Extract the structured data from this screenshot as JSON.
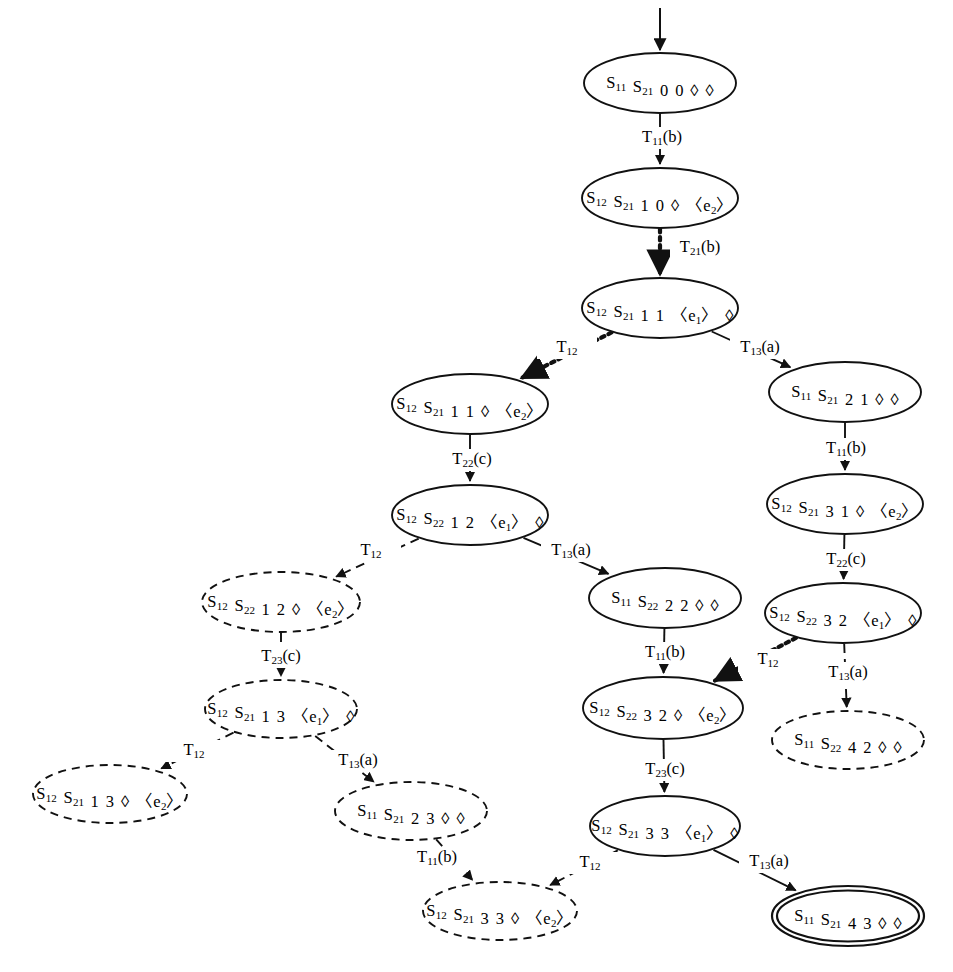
{
  "figure": {
    "kind": "reachability-graph",
    "background_color": "#ffffff",
    "stroke_color": "#111111",
    "text_color": "#000000",
    "diamond_glyph": "◊",
    "node_count": 17,
    "edge_count": 16
  },
  "nodes": [
    {
      "id": "n00",
      "label": "S11 S21 0 0 ◊ ◊",
      "state1": "S11",
      "state2": "S21",
      "counter1": "0",
      "counter2": "0",
      "queue1": "◊",
      "queue2": "◊",
      "style": "solid",
      "cx": 660,
      "cy": 83,
      "rx": 76,
      "ry": 30
    },
    {
      "id": "n10",
      "label": "S12 S21 1 0 ◊ 〈e2〉",
      "state1": "S12",
      "state2": "S21",
      "counter1": "1",
      "counter2": "0",
      "queue1": "◊",
      "queue2": "〈e2〉",
      "style": "solid",
      "cx": 660,
      "cy": 198,
      "rx": 78,
      "ry": 30
    },
    {
      "id": "n11a",
      "label": "S12 S21 1 1 〈e1〉 ◊",
      "state1": "S12",
      "state2": "S21",
      "counter1": "1",
      "counter2": "1",
      "queue1": "〈e1〉",
      "queue2": "◊",
      "style": "solid",
      "cx": 660,
      "cy": 308,
      "rx": 78,
      "ry": 30
    },
    {
      "id": "n11b",
      "label": "S12 S21 1 1 ◊ 〈e2〉",
      "state1": "S12",
      "state2": "S21",
      "counter1": "1",
      "counter2": "1",
      "queue1": "◊",
      "queue2": "〈e2〉",
      "style": "solid",
      "cx": 470,
      "cy": 404,
      "rx": 78,
      "ry": 30
    },
    {
      "id": "n21",
      "label": "S11 S21 2 1 ◊ ◊",
      "state1": "S11",
      "state2": "S21",
      "counter1": "2",
      "counter2": "1",
      "queue1": "◊",
      "queue2": "◊",
      "style": "solid",
      "cx": 845,
      "cy": 392,
      "rx": 76,
      "ry": 30
    },
    {
      "id": "n12",
      "label": "S12 S22 1 2 〈e1〉 ◊",
      "state1": "S12",
      "state2": "S22",
      "counter1": "1",
      "counter2": "2",
      "queue1": "〈e1〉",
      "queue2": "◊",
      "style": "solid",
      "cx": 470,
      "cy": 515,
      "rx": 78,
      "ry": 30
    },
    {
      "id": "n31",
      "label": "S12 S21 3 1 ◊ 〈e2〉",
      "state1": "S12",
      "state2": "S21",
      "counter1": "3",
      "counter2": "1",
      "queue1": "◊",
      "queue2": "〈e2〉",
      "style": "solid",
      "cx": 845,
      "cy": 504,
      "rx": 78,
      "ry": 30
    },
    {
      "id": "n12d",
      "label": "S12 S22 1 2 ◊ 〈e2〉",
      "state1": "S12",
      "state2": "S22",
      "counter1": "1",
      "counter2": "2",
      "queue1": "◊",
      "queue2": "〈e2〉",
      "style": "dashed",
      "cx": 281,
      "cy": 602,
      "rx": 79,
      "ry": 30
    },
    {
      "id": "n22",
      "label": "S11 S22 2 2 ◊ ◊",
      "state1": "S11",
      "state2": "S22",
      "counter1": "2",
      "counter2": "2",
      "queue1": "◊",
      "queue2": "◊",
      "style": "solid",
      "cx": 665,
      "cy": 598,
      "rx": 76,
      "ry": 30
    },
    {
      "id": "n32a",
      "label": "S12 S22 3 2 〈e1〉 ◊",
      "state1": "S12",
      "state2": "S22",
      "counter1": "3",
      "counter2": "2",
      "queue1": "〈e1〉",
      "queue2": "◊",
      "style": "solid",
      "cx": 843,
      "cy": 613,
      "rx": 78,
      "ry": 30
    },
    {
      "id": "n13a",
      "label": "S12 S21 1 3 〈e1〉 ◊",
      "state1": "S12",
      "state2": "S21",
      "counter1": "1",
      "counter2": "3",
      "queue1": "〈e1〉",
      "queue2": "◊",
      "style": "dashed",
      "cx": 281,
      "cy": 709,
      "rx": 76,
      "ry": 29
    },
    {
      "id": "n32b",
      "label": "S12 S22 3 2 ◊ 〈e2〉",
      "state1": "S12",
      "state2": "S22",
      "counter1": "3",
      "counter2": "2",
      "queue1": "◊",
      "queue2": "〈e2〉",
      "style": "solid",
      "cx": 663,
      "cy": 708,
      "rx": 80,
      "ry": 31
    },
    {
      "id": "n42",
      "label": "S11 S22 4 2 ◊ ◊",
      "state1": "S11",
      "state2": "S22",
      "counter1": "4",
      "counter2": "2",
      "queue1": "◊",
      "queue2": "◊",
      "style": "dashed",
      "cx": 848,
      "cy": 740,
      "rx": 76,
      "ry": 29
    },
    {
      "id": "n13b",
      "label": "S12 S21 1 3 ◊ 〈e2〉",
      "state1": "S12",
      "state2": "S21",
      "counter1": "1",
      "counter2": "3",
      "queue1": "◊",
      "queue2": "〈e2〉",
      "style": "dashed",
      "cx": 110,
      "cy": 794,
      "rx": 77,
      "ry": 29
    },
    {
      "id": "n23",
      "label": "S11 S21 2 3 ◊ ◊",
      "state1": "S11",
      "state2": "S21",
      "counter1": "2",
      "counter2": "3",
      "queue1": "◊",
      "queue2": "◊",
      "style": "dashed",
      "cx": 411,
      "cy": 811,
      "rx": 76,
      "ry": 29
    },
    {
      "id": "n33a",
      "label": "S12 S21 3 3 〈e1〉 ◊",
      "state1": "S12",
      "state2": "S21",
      "counter1": "3",
      "counter2": "3",
      "queue1": "〈e1〉",
      "queue2": "◊",
      "style": "solid",
      "cx": 665,
      "cy": 826,
      "rx": 75,
      "ry": 30
    },
    {
      "id": "n33b",
      "label": "S12 S21 3 3 ◊ 〈e2〉",
      "state1": "S12",
      "state2": "S21",
      "counter1": "3",
      "counter2": "3",
      "queue1": "◊",
      "queue2": "〈e2〉",
      "style": "dashed",
      "cx": 500,
      "cy": 911,
      "rx": 77,
      "ry": 29
    },
    {
      "id": "n43",
      "label": "S11 S21 4 3 ◊ ◊",
      "state1": "S11",
      "state2": "S21",
      "counter1": "4",
      "counter2": "3",
      "queue1": "◊",
      "queue2": "◊",
      "style": "double",
      "cx": 848,
      "cy": 916,
      "rx": 76,
      "ry": 30
    }
  ],
  "edges": [
    {
      "id": "e_init",
      "from": "",
      "to": "n00",
      "label": "",
      "style": "solid",
      "label_x": 0,
      "label_y": 0
    },
    {
      "id": "e1",
      "from": "n00",
      "to": "n10",
      "label": "T11(b)",
      "trans": "T11",
      "event": "b",
      "style": "solid",
      "label_x": 662,
      "label_y": 138
    },
    {
      "id": "e2",
      "from": "n10",
      "to": "n11a",
      "label": "T21(b)",
      "trans": "T21",
      "event": "b",
      "style": "dotted",
      "label_x": 700,
      "label_y": 248
    },
    {
      "id": "e3",
      "from": "n11a",
      "to": "n11b",
      "label": "T12",
      "trans": "T12",
      "event": "",
      "style": "dotted",
      "label_x": 567,
      "label_y": 348
    },
    {
      "id": "e4",
      "from": "n11a",
      "to": "n21",
      "label": "T13(a)",
      "trans": "T13",
      "event": "a",
      "style": "solid",
      "label_x": 760,
      "label_y": 348
    },
    {
      "id": "e5",
      "from": "n11b",
      "to": "n12",
      "label": "T22(c)",
      "trans": "T22",
      "event": "c",
      "style": "solid",
      "label_x": 472,
      "label_y": 460
    },
    {
      "id": "e6",
      "from": "n21",
      "to": "n31",
      "label": "T11(b)",
      "trans": "T11",
      "event": "b",
      "style": "solid",
      "label_x": 846,
      "label_y": 449
    },
    {
      "id": "e7",
      "from": "n12",
      "to": "n12d",
      "label": "T12",
      "trans": "T12",
      "event": "",
      "style": "dashed",
      "label_x": 371,
      "label_y": 551
    },
    {
      "id": "e8",
      "from": "n12",
      "to": "n22",
      "label": "T13(a)",
      "trans": "T13",
      "event": "a",
      "style": "solid",
      "label_x": 571,
      "label_y": 551
    },
    {
      "id": "e9",
      "from": "n31",
      "to": "n32a",
      "label": "T22(c)",
      "trans": "T22",
      "event": "c",
      "style": "solid",
      "label_x": 846,
      "label_y": 560
    },
    {
      "id": "e10",
      "from": "n12d",
      "to": "n13a",
      "label": "T23(c)",
      "trans": "T23",
      "event": "c",
      "style": "dashed",
      "label_x": 281,
      "label_y": 657
    },
    {
      "id": "e11",
      "from": "n22",
      "to": "n32b",
      "label": "T11(b)",
      "trans": "T11",
      "event": "b",
      "style": "solid",
      "label_x": 665,
      "label_y": 653
    },
    {
      "id": "e12",
      "from": "n32a",
      "to": "n32b",
      "label": "T12",
      "trans": "T12",
      "event": "",
      "style": "dotted",
      "label_x": 768,
      "label_y": 660
    },
    {
      "id": "e13",
      "from": "n32a",
      "to": "n42",
      "label": "T13(a)",
      "trans": "T13",
      "event": "a",
      "style": "dashed",
      "label_x": 848,
      "label_y": 673
    },
    {
      "id": "e14",
      "from": "n13a",
      "to": "n13b",
      "label": "T12",
      "trans": "T12",
      "event": "",
      "style": "dashed",
      "label_x": 194,
      "label_y": 751
    },
    {
      "id": "e15",
      "from": "n13a",
      "to": "n23",
      "label": "T13(a)",
      "trans": "T13",
      "event": "a",
      "style": "dashed",
      "label_x": 358,
      "label_y": 761
    },
    {
      "id": "e16",
      "from": "n32b",
      "to": "n33a",
      "label": "T23(c)",
      "trans": "T23",
      "event": "c",
      "style": "solid",
      "label_x": 665,
      "label_y": 770
    },
    {
      "id": "e17",
      "from": "n23",
      "to": "n33b",
      "label": "T11(b)",
      "trans": "T11",
      "event": "b",
      "style": "dashed",
      "label_x": 437,
      "label_y": 858
    },
    {
      "id": "e18",
      "from": "n33a",
      "to": "n33b",
      "label": "T12",
      "trans": "T12",
      "event": "",
      "style": "dashed",
      "label_x": 590,
      "label_y": 863
    },
    {
      "id": "e19",
      "from": "n33a",
      "to": "n43",
      "label": "T13(a)",
      "trans": "T13",
      "event": "a",
      "style": "solid",
      "label_x": 769,
      "label_y": 862
    }
  ]
}
